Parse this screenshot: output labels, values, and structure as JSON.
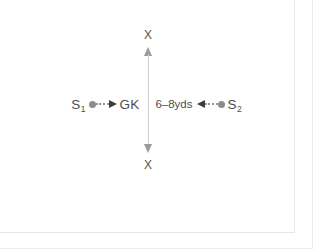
{
  "diagram": {
    "type": "field-drill",
    "colors": {
      "marker": "#8c8c8c",
      "arrowhead": "#3d3d3d",
      "axis_line": "#cfcfcf",
      "axis_arrow": "#9a9a9a",
      "text": "#4d4d4d",
      "frame": "#e6e6e6",
      "background": "#ffffff"
    },
    "vertical_axis": {
      "name": "movement-axis",
      "top_label": "X",
      "bottom_label": "X",
      "arrow_style": "double-headed",
      "line_style": "solid"
    },
    "center": {
      "label": "GK",
      "role": "goalkeeper"
    },
    "left_server": {
      "label": "S",
      "subscript": "1",
      "marker": "filled-circle",
      "connector": "dotted-arrow",
      "direction": "right"
    },
    "right_server": {
      "label": "S",
      "subscript": "2",
      "marker": "filled-circle",
      "connector": "dotted-arrow",
      "direction": "left"
    },
    "distance_label": "6–8yds"
  }
}
